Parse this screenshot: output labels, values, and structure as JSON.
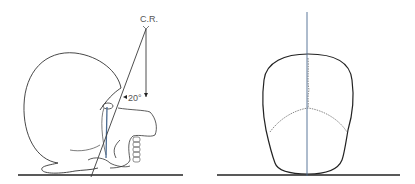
{
  "figure": {
    "panels": [
      {
        "id": "lateral-view",
        "description": "Lateral skull with central ray angled 20 degrees",
        "labels": {
          "central_ray": "C.R.",
          "angle": "20°"
        }
      },
      {
        "id": "frontal-view",
        "description": "Posterior skull view with vertical midline"
      }
    ],
    "colors": {
      "outline": "#2a2a2a",
      "ray": "#3a3a3a",
      "blue_line": "#4a6a90",
      "baseline": "#222222"
    }
  }
}
